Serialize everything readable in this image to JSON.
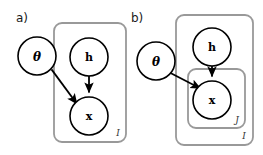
{
  "figure": {
    "width": 263,
    "height": 155,
    "background": "#ffffff",
    "type": "plate-notation-graphical-model"
  },
  "style": {
    "node_stroke": "#000000",
    "node_fill": "#ffffff",
    "node_stroke_width": 1.6,
    "plate_stroke": "#999999",
    "plate_stroke_width": 1.8,
    "plate_corner_radius": 8,
    "arrow_color": "#000000",
    "arrow_width": 1.8,
    "label_color": "#1a1a1a",
    "plate_label_color": "#333333"
  },
  "panels": [
    {
      "id": "a",
      "label": "a)",
      "label_x": 16,
      "label_y": 22,
      "nodes": [
        {
          "id": "theta-a",
          "label": "θ",
          "name": "node-theta",
          "cx": 37,
          "cy": 56,
          "r": 19,
          "inside_plate": false
        },
        {
          "id": "h-a",
          "label": "h",
          "name": "node-h",
          "cx": 89,
          "cy": 57,
          "r": 19,
          "inside_plate": true
        },
        {
          "id": "x-a",
          "label": "x",
          "name": "node-x",
          "cx": 89,
          "cy": 116,
          "r": 19,
          "inside_plate": true
        }
      ],
      "edges": [
        {
          "id": "theta-to-x-a",
          "from": "theta-a",
          "to": "x-a",
          "name": "edge-theta-to-x"
        },
        {
          "id": "h-to-x-a",
          "from": "h-a",
          "to": "x-a",
          "name": "edge-h-to-x"
        }
      ],
      "plates": [
        {
          "id": "plate-I-a",
          "label": "I",
          "name": "plate-i",
          "x": 54,
          "y": 23,
          "width": 72,
          "height": 119,
          "label_x": 118,
          "label_y": 136
        }
      ]
    },
    {
      "id": "b",
      "label": "b)",
      "label_x": 131,
      "label_y": 22,
      "nodes": [
        {
          "id": "theta-b",
          "label": "θ",
          "name": "node-theta",
          "cx": 156,
          "cy": 61,
          "r": 19,
          "inside_plate": false
        },
        {
          "id": "h-b",
          "label": "h",
          "name": "node-h",
          "cx": 212,
          "cy": 47,
          "r": 19,
          "inside_plate": true
        },
        {
          "id": "x-b",
          "label": "x",
          "name": "node-x",
          "cx": 212,
          "cy": 100,
          "r": 19,
          "inside_plate": true
        }
      ],
      "edges": [
        {
          "id": "theta-to-x-b",
          "from": "theta-b",
          "to": "x-b",
          "name": "edge-theta-to-x"
        },
        {
          "id": "h-to-x-b",
          "from": "h-b",
          "to": "x-b",
          "name": "edge-h-to-x"
        }
      ],
      "plates": [
        {
          "id": "plate-I-b",
          "label": "I",
          "name": "plate-i",
          "x": 176,
          "y": 15,
          "width": 77,
          "height": 130,
          "label_x": 244,
          "label_y": 139
        },
        {
          "id": "plate-J-b",
          "label": "J",
          "name": "plate-j",
          "x": 188,
          "y": 69,
          "width": 57,
          "height": 59,
          "label_x": 237,
          "label_y": 123
        }
      ]
    }
  ]
}
